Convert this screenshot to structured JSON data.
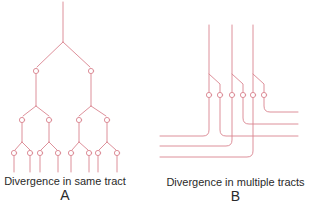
{
  "colors": {
    "line": "#d9838f",
    "text": "#2a2a2a",
    "background": "#ffffff"
  },
  "panel_a": {
    "caption": "Divergence in same tract",
    "letter": "A",
    "description": "Single axon trunk repeatedly bifurcating with boutons at each branch point: 1 trunk → 2 → 4 → 8 terminal branches"
  },
  "panel_b": {
    "caption": "Divergence  in multiple tracts",
    "letter": "B",
    "description": "Three parallel vertical axons, each giving off a collateral; six boutons whose fibers turn into separate horizontal tracts"
  }
}
